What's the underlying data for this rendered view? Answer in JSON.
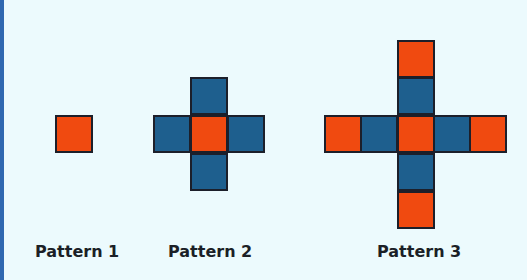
{
  "colors": {
    "background": "#ecfafd",
    "accent_bar": "#2f68b0",
    "orange": "#f04a10",
    "blue": "#1e5f8e",
    "outline": "#1c1f2a"
  },
  "patterns": [
    {
      "label": "Pattern 1",
      "squares": [
        {
          "row": 0,
          "col": 0,
          "color": "orange"
        }
      ]
    },
    {
      "label": "Pattern 2",
      "squares": [
        {
          "row": -1,
          "col": 0,
          "color": "blue"
        },
        {
          "row": 0,
          "col": -1,
          "color": "blue"
        },
        {
          "row": 0,
          "col": 0,
          "color": "orange"
        },
        {
          "row": 0,
          "col": 1,
          "color": "blue"
        },
        {
          "row": 1,
          "col": 0,
          "color": "blue"
        }
      ]
    },
    {
      "label": "Pattern 3",
      "squares": [
        {
          "row": -2,
          "col": 0,
          "color": "orange"
        },
        {
          "row": -1,
          "col": 0,
          "color": "blue"
        },
        {
          "row": 0,
          "col": -2,
          "color": "orange"
        },
        {
          "row": 0,
          "col": -1,
          "color": "blue"
        },
        {
          "row": 0,
          "col": 0,
          "color": "orange"
        },
        {
          "row": 0,
          "col": 1,
          "color": "blue"
        },
        {
          "row": 0,
          "col": 2,
          "color": "orange"
        },
        {
          "row": 1,
          "col": 0,
          "color": "blue"
        },
        {
          "row": 2,
          "col": 0,
          "color": "orange"
        }
      ]
    }
  ]
}
